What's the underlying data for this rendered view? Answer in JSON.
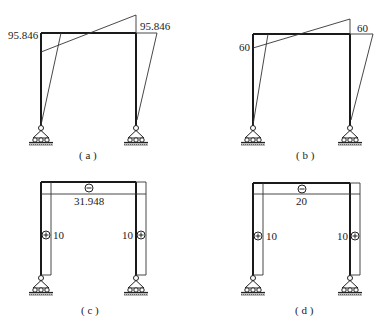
{
  "panels": [
    {
      "id": "a",
      "caption": "( a )",
      "type": "bending-moment",
      "labels": {
        "left_moment": "95.846",
        "right_moment": "95.846"
      }
    },
    {
      "id": "b",
      "caption": "( b )",
      "type": "bending-moment",
      "labels": {
        "left_moment": "60",
        "right_moment": "60"
      }
    },
    {
      "id": "c",
      "caption": "( c )",
      "type": "axial-force",
      "labels": {
        "beam_value": "31.948",
        "left_column_value": "10",
        "right_column_value": "10",
        "beam_sign": "−",
        "column_sign": "+"
      }
    },
    {
      "id": "d",
      "caption": "( d )",
      "type": "axial-force",
      "labels": {
        "beam_value": "20",
        "left_column_value": "10",
        "right_column_value": "10",
        "beam_sign": "−",
        "column_sign": "+"
      }
    }
  ],
  "colors": {
    "frame": "#1a1a1a",
    "diagram": "#333333",
    "ground": "#888888"
  }
}
